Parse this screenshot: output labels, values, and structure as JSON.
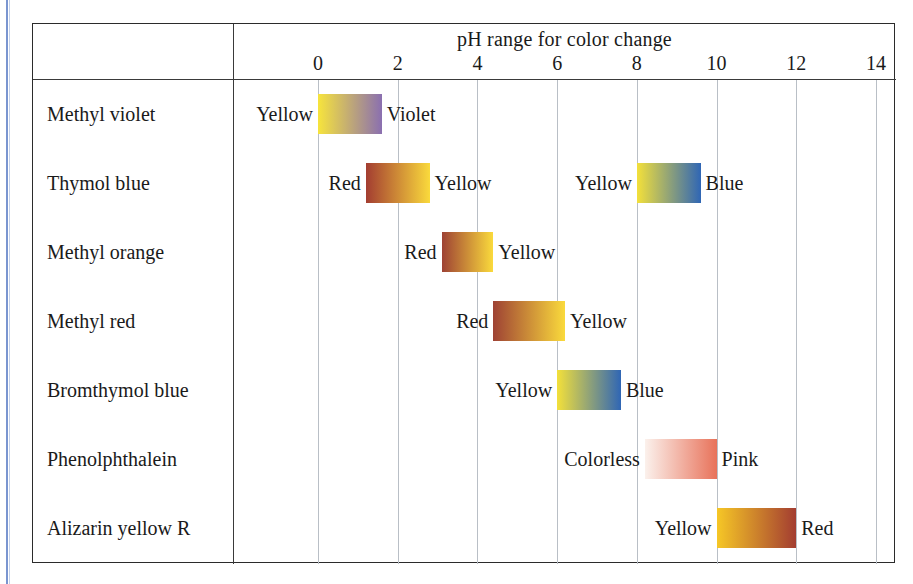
{
  "figure": {
    "title": "pH range for color change",
    "row_header": "",
    "axis": {
      "ticks": [
        0,
        2,
        4,
        6,
        8,
        10,
        12,
        14
      ],
      "min": 0,
      "max": 14,
      "gridlines": [
        0,
        2,
        4,
        6,
        8,
        10,
        12,
        14
      ]
    }
  },
  "chart_data": {
    "type": "table",
    "title": "pH range for color change",
    "xlabel": "pH range for color change",
    "ylabel": "",
    "xlim": [
      0,
      14
    ],
    "grid": true,
    "legend": "none",
    "categories": [
      "Methyl violet",
      "Thymol blue",
      "Methyl orange",
      "Methyl red",
      "Bromthymol blue",
      "Phenolphthalein",
      "Alizarin yellow R"
    ],
    "xticks": [
      0,
      2,
      4,
      6,
      8,
      10,
      12,
      14
    ],
    "indicators": [
      {
        "name": "Methyl violet",
        "bands": [
          {
            "acid_label": "Yellow",
            "base_label": "Violet",
            "ph_low": 0.0,
            "ph_high": 1.6,
            "color_low": "#f7e43c",
            "color_high": "#8a6fb0"
          }
        ]
      },
      {
        "name": "Thymol blue",
        "bands": [
          {
            "acid_label": "Red",
            "base_label": "Yellow",
            "ph_low": 1.2,
            "ph_high": 2.8,
            "color_low": "#a33d31",
            "color_high": "#fada3c"
          },
          {
            "acid_label": "Yellow",
            "base_label": "Blue",
            "ph_low": 8.0,
            "ph_high": 9.6,
            "color_low": "#f3e03a",
            "color_high": "#2f66b5"
          }
        ]
      },
      {
        "name": "Methyl orange",
        "bands": [
          {
            "acid_label": "Red",
            "base_label": "Yellow",
            "ph_low": 3.1,
            "ph_high": 4.4,
            "color_low": "#9e4234",
            "color_high": "#fada3c"
          }
        ]
      },
      {
        "name": "Methyl red",
        "bands": [
          {
            "acid_label": "Red",
            "base_label": "Yellow",
            "ph_low": 4.4,
            "ph_high": 6.2,
            "color_low": "#9e4234",
            "color_high": "#fada3c"
          }
        ]
      },
      {
        "name": "Bromthymol blue",
        "bands": [
          {
            "acid_label": "Yellow",
            "base_label": "Blue",
            "ph_low": 6.0,
            "ph_high": 7.6,
            "color_low": "#f3e03a",
            "color_high": "#2f66b5"
          }
        ]
      },
      {
        "name": "Phenolphthalein",
        "bands": [
          {
            "acid_label": "Colorless",
            "base_label": "Pink",
            "ph_low": 8.2,
            "ph_high": 10.0,
            "color_low": "#fbf1ec",
            "color_high": "#e8725a"
          }
        ]
      },
      {
        "name": "Alizarin yellow R",
        "bands": [
          {
            "acid_label": "Yellow",
            "base_label": "Red",
            "ph_low": 10.0,
            "ph_high": 12.0,
            "color_low": "#f6c726",
            "color_high": "#a33d31"
          }
        ]
      }
    ]
  },
  "colors": {
    "frame": "#2b2b2b",
    "gridline": "#b9bfc6",
    "left_rule": "#7a95d0",
    "text": "#1a1a1a",
    "page": "#ffffff"
  }
}
